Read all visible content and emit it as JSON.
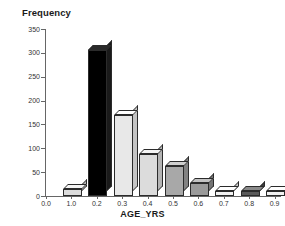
{
  "chart_data": {
    "type": "bar",
    "title": "Frequency",
    "xlabel": "AGE_YRS",
    "ylabel": "Frequency",
    "categories": [
      "0.0",
      "1.0",
      "0.2",
      "0.3",
      "0.4",
      "0.5",
      "0.6",
      "0.7",
      "0.8",
      "0.9"
    ],
    "values": [
      0,
      14,
      305,
      170,
      88,
      63,
      27,
      10,
      11,
      10
    ],
    "ylim": [
      0,
      350
    ],
    "yticks": [
      0,
      50,
      100,
      150,
      200,
      250,
      300,
      350
    ],
    "ytick_labels": [
      "0",
      "50",
      "100",
      "150",
      "200",
      "250",
      "300",
      "350"
    ],
    "grid": false,
    "legend": "none",
    "bar_colors": [
      "#f2f2f2",
      "#dcdcdc",
      "#000000",
      "#e8e8e8",
      "#dcdcdc",
      "#a8a8a8",
      "#9a9a9a",
      "#f2f2f2",
      "#5a5a5a",
      "#f2f2f2"
    ],
    "bar_top_colors": [
      "#ffffff",
      "#f5f5f5",
      "#2a2a2a",
      "#ffffff",
      "#f5f5f5",
      "#cfcfcf",
      "#c2c2c2",
      "#ffffff",
      "#8a8a8a",
      "#ffffff"
    ],
    "bar_side_colors": [
      "#c9c9c9",
      "#b4b4b4",
      "#1a1a1a",
      "#c4c4c4",
      "#b4b4b4",
      "#828282",
      "#747474",
      "#c9c9c9",
      "#3c3c3c",
      "#c9c9c9"
    ]
  },
  "axis_colors": {
    "axis": "#666666",
    "text": "#333333",
    "title": "#1a1a1a"
  }
}
